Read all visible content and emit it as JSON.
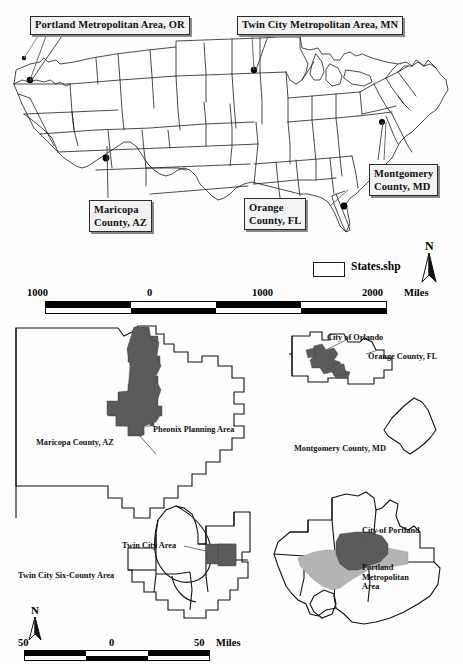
{
  "figure": {
    "colors": {
      "outline": "#1c1c1c",
      "dark_fill": "#5b5b5b",
      "light_fill": "#b4b4b4",
      "callout_bg": "#f2f2f2",
      "callout_shadow": "#8a8a8a"
    }
  },
  "national_map": {
    "callouts": [
      {
        "id": "portland",
        "label": "Portland Metropolitan Area, OR",
        "lines": [
          "Portland Metropolitan Area, OR"
        ]
      },
      {
        "id": "twincity",
        "label": "Twin City Metropolitan Area, MN",
        "lines": [
          "Twin City Metropolitan Area, MN"
        ]
      },
      {
        "id": "montgomery",
        "label": "Montgomery County, MD",
        "lines": [
          "Montgomery",
          "County, MD"
        ]
      },
      {
        "id": "maricopa",
        "label": "Maricopa County, AZ",
        "lines": [
          "Maricopa",
          "County, AZ"
        ]
      },
      {
        "id": "orange",
        "label": "Orange County, FL",
        "lines": [
          "Orange",
          "County, FL"
        ]
      }
    ],
    "legend": {
      "layer_name": "States.shp",
      "swatch": "white-rectangle"
    },
    "north_arrow": {
      "letter": "N"
    },
    "scale_bar": {
      "ticks": [
        "1000",
        "0",
        "1000",
        "2000"
      ],
      "unit": "Miles",
      "segments": 4
    }
  },
  "insets": [
    {
      "id": "maricopa",
      "county_label": "Maricopa County, AZ",
      "feature_label": "Pheonix Planning Area"
    },
    {
      "id": "orange",
      "county_label": "Orange County, FL",
      "feature_label": "City of Orlando"
    },
    {
      "id": "montgomery",
      "county_label": "Montgomery County, MD",
      "feature_label": ""
    },
    {
      "id": "twincity",
      "county_label": "Twin City Six-County Area",
      "feature_label": "Twin City Area"
    },
    {
      "id": "portland",
      "county_label": "Portland Metropolitan Area",
      "feature_label": "City of Portland"
    }
  ],
  "inset_scale": {
    "ticks": [
      "50",
      "0",
      "50"
    ],
    "unit": "Miles",
    "north_arrow": {
      "letter": "N"
    }
  }
}
